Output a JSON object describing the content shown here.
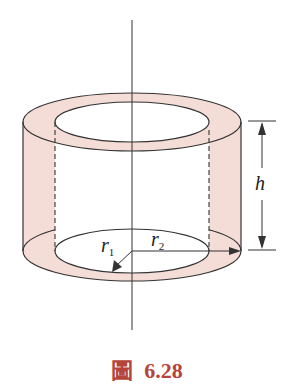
{
  "figure": {
    "caption_char": "圖",
    "caption_number": "6.28",
    "labels": {
      "h": "h",
      "r1": "r",
      "r1_sub": "1",
      "r2": "r",
      "r2_sub": "2"
    },
    "colors": {
      "fill": "#f4ddd6",
      "stroke": "#333333",
      "caption": "#b5443a"
    }
  }
}
